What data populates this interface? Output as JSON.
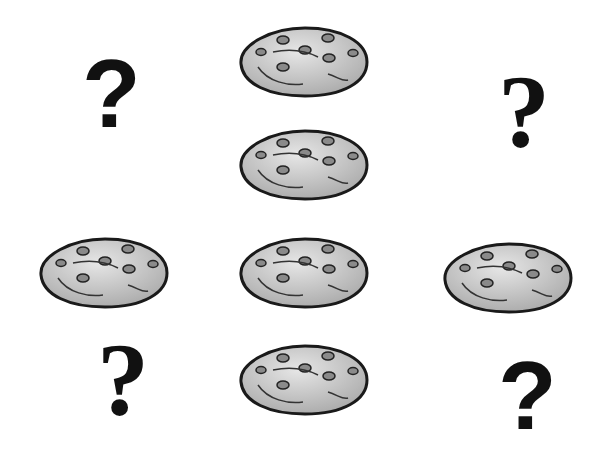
{
  "puzzle": {
    "title": "",
    "grid": {
      "columns": 3,
      "rows": 4,
      "cells": [
        {
          "col": 0,
          "row": 0,
          "type": "question",
          "symbol": "?",
          "style": "sans"
        },
        {
          "col": 1,
          "row": 0,
          "type": "cookie"
        },
        {
          "col": 2,
          "row": 0,
          "type": "question",
          "symbol": "?",
          "style": "serif"
        },
        {
          "col": 1,
          "row": 1,
          "type": "cookie"
        },
        {
          "col": 0,
          "row": 2,
          "type": "cookie"
        },
        {
          "col": 1,
          "row": 2,
          "type": "cookie"
        },
        {
          "col": 2,
          "row": 2,
          "type": "cookie"
        },
        {
          "col": 0,
          "row": 3,
          "type": "question",
          "symbol": "?",
          "style": "serif"
        },
        {
          "col": 1,
          "row": 3,
          "type": "cookie"
        },
        {
          "col": 2,
          "row": 3,
          "type": "question",
          "symbol": "?",
          "style": "sans"
        }
      ]
    },
    "labels": {
      "q1": "?",
      "q2": "?",
      "q3": "?",
      "q4": "?"
    },
    "colors": {
      "cookie_fill": "#c8c8c8",
      "cookie_outline": "#1a1a1a",
      "chip": "#8a8a8a",
      "question": "#111111"
    }
  }
}
